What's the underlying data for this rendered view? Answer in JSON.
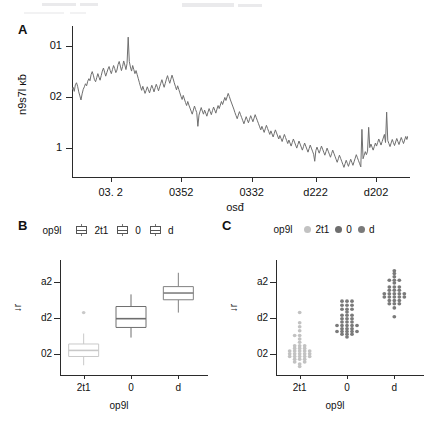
{
  "figure": {
    "panels": [
      {
        "letter": "A"
      },
      {
        "letter": "B"
      },
      {
        "letter": "C"
      }
    ]
  },
  "chart_data": [
    {
      "type": "line",
      "panel": "A",
      "title": "",
      "xlabel": "osđ",
      "ylabel": "n9s7l ĸƀ",
      "grid": false,
      "legend": "none",
      "xtick_labels": [
        "03. 2",
        "0352",
        "0332",
        "d222",
        "d202"
      ],
      "xtick_positions": [
        0.115,
        0.325,
        0.535,
        0.725,
        0.905
      ],
      "ytick_labels": [
        "01",
        "02",
        "1"
      ],
      "ytick_values": [
        30,
        20,
        10
      ],
      "ylim": [
        4,
        34
      ],
      "line_color": "#6f6f6f",
      "values": [
        21.4,
        21.9,
        21.1,
        22.4,
        22.8,
        22.1,
        21.0,
        20.2,
        19.4,
        20.6,
        21.5,
        22.0,
        22.6,
        22.2,
        23.1,
        23.6,
        23.2,
        24.4,
        25.0,
        24.3,
        23.4,
        23.0,
        23.8,
        24.6,
        23.9,
        23.3,
        24.2,
        25.1,
        25.7,
        24.9,
        24.1,
        24.8,
        25.5,
        26.0,
        25.2,
        24.6,
        25.4,
        26.2,
        25.6,
        24.8,
        25.3,
        26.4,
        27.0,
        26.1,
        25.2,
        26.0,
        27.1,
        26.3,
        25.4,
        26.6,
        31.8,
        27.0,
        25.9,
        25.1,
        26.2,
        25.4,
        24.6,
        25.2,
        24.4,
        23.6,
        22.8,
        22.0,
        21.3,
        22.1,
        21.4,
        20.7,
        21.3,
        22.0,
        21.4,
        20.8,
        21.6,
        22.3,
        21.7,
        21.0,
        21.8,
        22.5,
        21.9,
        21.2,
        22.0,
        22.7,
        23.4,
        22.6,
        21.9,
        22.7,
        23.5,
        24.2,
        23.4,
        22.7,
        23.5,
        24.3,
        23.6,
        22.8,
        22.1,
        21.4,
        22.2,
        21.5,
        20.8,
        20.1,
        19.5,
        20.3,
        19.6,
        18.9,
        18.3,
        19.1,
        18.4,
        17.8,
        17.2,
        16.6,
        17.4,
        18.2,
        17.5,
        16.9,
        14.2,
        16.4,
        17.2,
        17.9,
        17.2,
        16.6,
        17.4,
        16.8,
        16.2,
        17.0,
        17.7,
        17.1,
        16.5,
        17.3,
        18.0,
        17.4,
        16.8,
        17.6,
        18.3,
        17.7,
        18.4,
        19.1,
        18.5,
        19.2,
        19.9,
        19.3,
        20.0,
        20.7,
        20.1,
        19.4,
        18.8,
        18.2,
        17.6,
        16.9,
        16.3,
        15.7,
        16.4,
        17.1,
        16.5,
        15.9,
        15.3,
        14.7,
        15.4,
        16.1,
        15.5,
        14.9,
        15.6,
        16.3,
        15.7,
        15.1,
        15.8,
        16.5,
        15.9,
        15.3,
        14.7,
        14.1,
        13.5,
        14.2,
        13.6,
        13.0,
        13.7,
        14.4,
        13.8,
        13.2,
        12.6,
        13.3,
        12.7,
        12.1,
        12.8,
        13.5,
        12.9,
        12.3,
        11.7,
        12.4,
        11.8,
        11.2,
        11.9,
        12.6,
        12.0,
        11.4,
        10.8,
        11.5,
        10.9,
        10.3,
        11.0,
        11.7,
        11.1,
        10.5,
        9.9,
        10.6,
        11.3,
        10.7,
        10.1,
        9.5,
        10.2,
        10.9,
        10.3,
        9.7,
        9.1,
        9.8,
        10.5,
        9.9,
        9.3,
        8.7,
        7.3,
        9.4,
        10.1,
        9.5,
        8.9,
        9.6,
        10.3,
        9.7,
        9.1,
        8.5,
        9.2,
        9.9,
        9.3,
        8.7,
        8.1,
        8.8,
        9.5,
        8.9,
        8.3,
        7.7,
        7.1,
        7.8,
        8.5,
        7.9,
        7.3,
        6.7,
        6.1,
        6.8,
        7.5,
        6.9,
        6.3,
        7.0,
        7.7,
        7.1,
        6.5,
        7.2,
        7.9,
        8.6,
        8.0,
        7.4,
        6.8,
        6.2,
        13.6,
        7.8,
        8.5,
        9.2,
        8.6,
        9.3,
        14.0,
        10.0,
        10.7,
        10.1,
        9.5,
        10.2,
        10.9,
        10.3,
        11.0,
        11.7,
        11.1,
        10.5,
        11.2,
        11.9,
        12.6,
        11.0,
        17.0,
        11.4,
        10.8,
        10.2,
        10.9,
        11.6,
        11.0,
        10.4,
        11.1,
        11.8,
        11.2,
        10.6,
        11.3,
        12.0,
        11.4,
        10.8,
        11.5,
        12.2,
        11.6,
        12.3
      ]
    },
    {
      "type": "box",
      "panel": "B",
      "title": "",
      "xlabel": "op9l",
      "ylabel": "↓r",
      "legend_title": "op9l",
      "legend_position": "top",
      "categories": [
        "2t1",
        "0",
        "d"
      ],
      "ytick_labels": [
        "a2",
        "d2",
        "02"
      ],
      "ytick_values": [
        30,
        20,
        10
      ],
      "ylim": [
        4,
        36
      ],
      "boxes": [
        {
          "name": "2t1",
          "color": "#c9c9c9",
          "min": 6.0,
          "q1": 8.6,
          "median": 10.4,
          "q3": 12.3,
          "max": 15.4,
          "outliers": [
            21.6
          ]
        },
        {
          "name": "0",
          "color": "#6e6e6e",
          "min": 14.2,
          "q1": 17.2,
          "median": 19.8,
          "q3": 23.4,
          "max": 27.0,
          "outliers": []
        },
        {
          "name": "d",
          "color": "#808080",
          "min": 21.6,
          "q1": 25.4,
          "median": 27.4,
          "q3": 29.3,
          "max": 33.4,
          "outliers": []
        }
      ]
    },
    {
      "type": "scatter",
      "panel": "C",
      "title": "",
      "xlabel": "op9l",
      "ylabel": "↓r",
      "legend_title": "op9l",
      "legend_position": "top",
      "categories": [
        "2t1",
        "0",
        "d"
      ],
      "ytick_labels": [
        "a2",
        "d2",
        "02"
      ],
      "ytick_values": [
        30,
        20,
        10
      ],
      "ylim": [
        4,
        36
      ],
      "groups": [
        {
          "name": "2t1",
          "color": "#c2c2c2",
          "points": [
            [
              0,
              5.6
            ],
            [
              0,
              6.4
            ],
            [
              -1,
              7.0
            ],
            [
              1,
              7.0
            ],
            [
              -1,
              7.8
            ],
            [
              0,
              7.8
            ],
            [
              1,
              7.8
            ],
            [
              -2,
              8.6
            ],
            [
              -1,
              8.6
            ],
            [
              0,
              8.6
            ],
            [
              1,
              8.6
            ],
            [
              2,
              8.6
            ],
            [
              -2,
              9.4
            ],
            [
              -1,
              9.4
            ],
            [
              0,
              9.4
            ],
            [
              1,
              9.4
            ],
            [
              2,
              9.4
            ],
            [
              -2,
              10.2
            ],
            [
              -1,
              10.2
            ],
            [
              0,
              10.2
            ],
            [
              1,
              10.2
            ],
            [
              2,
              10.2
            ],
            [
              -1,
              11.0
            ],
            [
              0,
              11.0
            ],
            [
              1,
              11.0
            ],
            [
              -1,
              11.8
            ],
            [
              0,
              11.8
            ],
            [
              1,
              11.8
            ],
            [
              0,
              12.8
            ],
            [
              0,
              13.8
            ],
            [
              -1,
              14.8
            ],
            [
              0,
              14.8
            ],
            [
              0,
              16.2
            ],
            [
              0,
              17.4
            ],
            [
              0,
              18.6
            ],
            [
              0,
              21.6
            ]
          ]
        },
        {
          "name": "0",
          "color": "#7a7a7a",
          "points": [
            [
              0,
              14.4
            ],
            [
              -1,
              15.2
            ],
            [
              0,
              15.2
            ],
            [
              1,
              15.2
            ],
            [
              -2,
              16.0
            ],
            [
              -1,
              16.0
            ],
            [
              0,
              16.0
            ],
            [
              1,
              16.0
            ],
            [
              2,
              16.0
            ],
            [
              -1,
              16.8
            ],
            [
              0,
              16.8
            ],
            [
              1,
              16.8
            ],
            [
              -2,
              17.8
            ],
            [
              -1,
              17.8
            ],
            [
              0,
              17.8
            ],
            [
              1,
              17.8
            ],
            [
              2,
              17.8
            ],
            [
              -1,
              18.8
            ],
            [
              0,
              18.8
            ],
            [
              1,
              18.8
            ],
            [
              -1,
              19.8
            ],
            [
              0,
              19.8
            ],
            [
              1,
              19.8
            ],
            [
              -1,
              20.8
            ],
            [
              0,
              20.8
            ],
            [
              1,
              20.8
            ],
            [
              0,
              21.8
            ],
            [
              -1,
              22.6
            ],
            [
              0,
              22.6
            ],
            [
              1,
              22.6
            ],
            [
              -1,
              23.8
            ],
            [
              0,
              23.8
            ],
            [
              1,
              23.8
            ],
            [
              -1,
              25.0
            ],
            [
              0,
              25.0
            ],
            [
              1,
              25.0
            ]
          ]
        },
        {
          "name": "d",
          "color": "#7a7a7a",
          "points": [
            [
              0,
              20.4
            ],
            [
              0,
              23.0
            ],
            [
              -1,
              24.2
            ],
            [
              0,
              24.2
            ],
            [
              1,
              24.2
            ],
            [
              -1,
              25.2
            ],
            [
              0,
              25.2
            ],
            [
              1,
              25.2
            ],
            [
              -2,
              26.2
            ],
            [
              -1,
              26.2
            ],
            [
              0,
              26.2
            ],
            [
              1,
              26.2
            ],
            [
              2,
              26.2
            ],
            [
              -2,
              27.2
            ],
            [
              -1,
              27.2
            ],
            [
              0,
              27.2
            ],
            [
              1,
              27.2
            ],
            [
              2,
              27.2
            ],
            [
              -1,
              28.2
            ],
            [
              0,
              28.2
            ],
            [
              1,
              28.2
            ],
            [
              -1,
              29.2
            ],
            [
              0,
              29.2
            ],
            [
              1,
              29.2
            ],
            [
              0,
              30.4
            ],
            [
              -1,
              31.2
            ],
            [
              0,
              31.2
            ],
            [
              1,
              31.2
            ],
            [
              0,
              32.2
            ],
            [
              0,
              33.2
            ],
            [
              0,
              34.0
            ]
          ]
        }
      ]
    }
  ],
  "panelA": {
    "letter": "A",
    "ylabel": "n9s7l ĸƀ",
    "xlabel": "osđ",
    "ytick_labels": [
      "01",
      "02",
      "1"
    ],
    "xtick_labels": [
      "03. 2",
      "0352",
      "0332",
      "d222",
      "d202"
    ]
  },
  "panelB": {
    "letter": "B",
    "legend_title": "op9l",
    "legend_labels": [
      "2t1",
      "0",
      "d"
    ],
    "ylabel": "↓r",
    "xlabel": "op9l",
    "ytick_labels": [
      "a2",
      "d2",
      "02"
    ],
    "xtick_labels": [
      "2t1",
      "0",
      "d"
    ]
  },
  "panelC": {
    "letter": "C",
    "legend_title": "op9l",
    "legend_labels": [
      "2t1",
      "0",
      "d"
    ],
    "ylabel": "↓r",
    "xlabel": "op9l",
    "ytick_labels": [
      "a2",
      "d2",
      "02"
    ],
    "xtick_labels": [
      "2t1",
      "0",
      "d"
    ]
  },
  "colors": {
    "line": "#6f6f6f",
    "axis": "#2b2b2b",
    "group_light": "#c9c9c9",
    "group_mid": "#7a7a7a",
    "group_dark": "#6e6e6e",
    "background": "#ffffff"
  }
}
